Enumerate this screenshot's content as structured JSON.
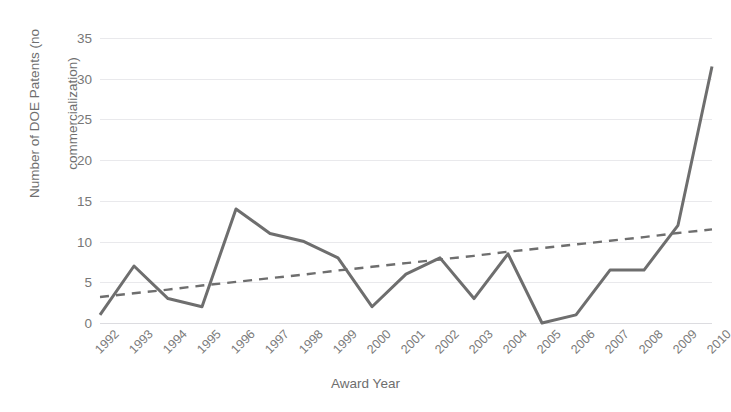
{
  "chart_data": {
    "type": "line",
    "title": "",
    "xlabel": "Award Year",
    "ylabel": "Number of DOE Patents (no commercialization)",
    "ylabel_line1": "Number of DOE Patents (no",
    "ylabel_line2": "commercialization)",
    "categories": [
      "1992",
      "1993",
      "1994",
      "1995",
      "1996",
      "1997",
      "1998",
      "1999",
      "2000",
      "2001",
      "2002",
      "2003",
      "2004",
      "2005",
      "2006",
      "2007",
      "2008",
      "2009",
      "2010"
    ],
    "series": [
      {
        "name": "Number of DOE Patents (no commercialization)",
        "style": "solid",
        "color": "#6e6e6e",
        "values": [
          1,
          7,
          3,
          2,
          14,
          11,
          10,
          8,
          2,
          6,
          8,
          3,
          8.5,
          0,
          1,
          6.5,
          6.5,
          12,
          31.5
        ]
      },
      {
        "name": "Linear trendline",
        "style": "dashed",
        "color": "#6e6e6e",
        "values": [
          3.2,
          3.65,
          4.1,
          4.6,
          5.05,
          5.5,
          5.95,
          6.45,
          6.9,
          7.35,
          7.8,
          8.25,
          8.75,
          9.2,
          9.65,
          10.1,
          10.55,
          11.05,
          11.5
        ]
      }
    ],
    "yticks": [
      0,
      5,
      10,
      15,
      20,
      25,
      30,
      35
    ],
    "ylim": [
      0,
      35
    ],
    "grid": true,
    "legend": "none",
    "gridline_color": "#e9e9ec",
    "axis_color": "#dcdce0",
    "text_color": "#6e6e6e",
    "background": "#ffffff"
  }
}
